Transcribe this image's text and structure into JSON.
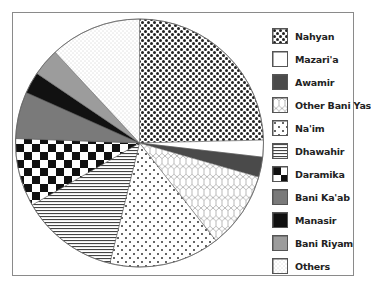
{
  "chart_data": {
    "type": "pie",
    "title": "",
    "start_angle_deg": 0,
    "direction": "clockwise",
    "legend_position": "right",
    "categories": [
      "Nahyan",
      "Mazari'a",
      "Awamir",
      "Other Bani Yas",
      "Na'im",
      "Dhawahir",
      "Daramika",
      "Bani Ka'ab",
      "Manasir",
      "Bani Riyam",
      "Others"
    ],
    "values": [
      24.6,
      2.2,
      2.6,
      10.0,
      14.4,
      12.8,
      8.9,
      6.1,
      2.8,
      3.6,
      11.9
    ],
    "unit": "percent (estimated from slice angles)",
    "fills": [
      "checker-dots",
      "white",
      "dark-gray",
      "hexagon",
      "sparse-dots",
      "horizontal-lines",
      "checkerboard",
      "mid-gray",
      "black",
      "light-gray",
      "fine-dots"
    ]
  },
  "legend": {
    "items": [
      {
        "label": "Nahyan",
        "pattern": "p-nahyan"
      },
      {
        "label": "Mazari'a",
        "pattern": "p-mazaria"
      },
      {
        "label": "Awamir",
        "pattern": "p-awamir"
      },
      {
        "label": "Other Bani Yas",
        "pattern": "p-otherbaniyas"
      },
      {
        "label": "Na'im",
        "pattern": "p-naim"
      },
      {
        "label": "Dhawahir",
        "pattern": "p-dhawahir"
      },
      {
        "label": "Daramika",
        "pattern": "p-daramika"
      },
      {
        "label": "Bani Ka'ab",
        "pattern": "p-banikaab"
      },
      {
        "label": "Manasir",
        "pattern": "p-manasir"
      },
      {
        "label": "Bani Riyam",
        "pattern": "p-baniriyam"
      },
      {
        "label": "Others",
        "pattern": "p-others"
      }
    ]
  },
  "colors": {
    "frame": "#8a8a8a",
    "dark_gray": "#4a4a4a",
    "mid_gray": "#7a7a7a",
    "light_gray": "#9c9c9c",
    "black": "#111111"
  }
}
